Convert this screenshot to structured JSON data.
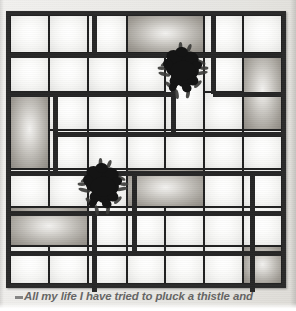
{
  "page": {
    "background_color": "#ecebe8",
    "border_color": "#2a2a2a"
  },
  "figure": {
    "type": "window-grid-illustration",
    "name": "window-pane-grid",
    "columns": 7,
    "rows": 7,
    "frame": {
      "x": 6,
      "y": 11,
      "width": 280,
      "height": 277,
      "border_width": 4
    },
    "pane_light_color": "#f6f6f4",
    "pane_dark_color": "#a19d96",
    "mullion_color": "#262626",
    "panes": [
      {
        "id": "r1c1",
        "col": 1,
        "row": 1,
        "col_span": 1,
        "row_span": 1,
        "shade": "light"
      },
      {
        "id": "r1c2",
        "col": 2,
        "row": 1,
        "col_span": 1,
        "row_span": 1,
        "shade": "light"
      },
      {
        "id": "r1c3",
        "col": 3,
        "row": 1,
        "col_span": 1,
        "row_span": 1,
        "shade": "light"
      },
      {
        "id": "r1c4",
        "col": 4,
        "row": 1,
        "col_span": 2,
        "row_span": 1,
        "shade": "dark"
      },
      {
        "id": "r1c6",
        "col": 6,
        "row": 1,
        "col_span": 1,
        "row_span": 1,
        "shade": "light"
      },
      {
        "id": "r1c7",
        "col": 7,
        "row": 1,
        "col_span": 1,
        "row_span": 1,
        "shade": "light"
      },
      {
        "id": "r2c1",
        "col": 1,
        "row": 2,
        "col_span": 1,
        "row_span": 1,
        "shade": "light"
      },
      {
        "id": "r2c2",
        "col": 2,
        "row": 2,
        "col_span": 1,
        "row_span": 1,
        "shade": "light"
      },
      {
        "id": "r2c3",
        "col": 3,
        "row": 2,
        "col_span": 1,
        "row_span": 1,
        "shade": "light"
      },
      {
        "id": "r2c4",
        "col": 4,
        "row": 2,
        "col_span": 1,
        "row_span": 1,
        "shade": "light"
      },
      {
        "id": "r2c5",
        "col": 5,
        "row": 2,
        "col_span": 1,
        "row_span": 2,
        "shade": "light"
      },
      {
        "id": "r2c6",
        "col": 6,
        "row": 2,
        "col_span": 1,
        "row_span": 1,
        "shade": "light"
      },
      {
        "id": "r2c7",
        "col": 7,
        "row": 2,
        "col_span": 1,
        "row_span": 2,
        "shade": "dark"
      },
      {
        "id": "r3c1",
        "col": 1,
        "row": 3,
        "col_span": 1,
        "row_span": 2,
        "shade": "dark"
      },
      {
        "id": "r3c2",
        "col": 2,
        "row": 3,
        "col_span": 1,
        "row_span": 1,
        "shade": "light"
      },
      {
        "id": "r3c3",
        "col": 3,
        "row": 3,
        "col_span": 1,
        "row_span": 1,
        "shade": "light"
      },
      {
        "id": "r3c4",
        "col": 4,
        "row": 3,
        "col_span": 1,
        "row_span": 1,
        "shade": "light"
      },
      {
        "id": "r3c6",
        "col": 6,
        "row": 3,
        "col_span": 1,
        "row_span": 1,
        "shade": "light"
      },
      {
        "id": "r4c2",
        "col": 2,
        "row": 4,
        "col_span": 1,
        "row_span": 1,
        "shade": "light"
      },
      {
        "id": "r4c3",
        "col": 3,
        "row": 4,
        "col_span": 1,
        "row_span": 1,
        "shade": "light"
      },
      {
        "id": "r4c4",
        "col": 4,
        "row": 4,
        "col_span": 1,
        "row_span": 1,
        "shade": "light"
      },
      {
        "id": "r4c5",
        "col": 5,
        "row": 4,
        "col_span": 1,
        "row_span": 1,
        "shade": "light"
      },
      {
        "id": "r4c6",
        "col": 6,
        "row": 4,
        "col_span": 1,
        "row_span": 1,
        "shade": "light"
      },
      {
        "id": "r4c7",
        "col": 7,
        "row": 4,
        "col_span": 1,
        "row_span": 1,
        "shade": "light"
      },
      {
        "id": "r5c1",
        "col": 1,
        "row": 5,
        "col_span": 1,
        "row_span": 1,
        "shade": "light"
      },
      {
        "id": "r5c2",
        "col": 2,
        "row": 5,
        "col_span": 1,
        "row_span": 1,
        "shade": "light"
      },
      {
        "id": "r5c3",
        "col": 3,
        "row": 5,
        "col_span": 1,
        "row_span": 1,
        "shade": "light"
      },
      {
        "id": "r5c4",
        "col": 4,
        "row": 5,
        "col_span": 2,
        "row_span": 1,
        "shade": "dark"
      },
      {
        "id": "r5c6",
        "col": 6,
        "row": 5,
        "col_span": 1,
        "row_span": 1,
        "shade": "light"
      },
      {
        "id": "r5c7",
        "col": 7,
        "row": 5,
        "col_span": 1,
        "row_span": 1,
        "shade": "light"
      },
      {
        "id": "r6c1",
        "col": 1,
        "row": 6,
        "col_span": 2,
        "row_span": 1,
        "shade": "dark"
      },
      {
        "id": "r6c3",
        "col": 3,
        "row": 6,
        "col_span": 1,
        "row_span": 1,
        "shade": "light"
      },
      {
        "id": "r6c4",
        "col": 4,
        "row": 6,
        "col_span": 1,
        "row_span": 1,
        "shade": "light"
      },
      {
        "id": "r6c5",
        "col": 5,
        "row": 6,
        "col_span": 1,
        "row_span": 1,
        "shade": "light"
      },
      {
        "id": "r6c6",
        "col": 6,
        "row": 6,
        "col_span": 1,
        "row_span": 1,
        "shade": "light"
      },
      {
        "id": "r6c7",
        "col": 7,
        "row": 6,
        "col_span": 1,
        "row_span": 1,
        "shade": "light"
      },
      {
        "id": "r7c1",
        "col": 1,
        "row": 7,
        "col_span": 1,
        "row_span": 1,
        "shade": "light"
      },
      {
        "id": "r7c2",
        "col": 2,
        "row": 7,
        "col_span": 1,
        "row_span": 1,
        "shade": "light"
      },
      {
        "id": "r7c3",
        "col": 3,
        "row": 7,
        "col_span": 1,
        "row_span": 1,
        "shade": "light"
      },
      {
        "id": "r7c4",
        "col": 4,
        "row": 7,
        "col_span": 1,
        "row_span": 1,
        "shade": "light"
      },
      {
        "id": "r7c5",
        "col": 5,
        "row": 7,
        "col_span": 1,
        "row_span": 1,
        "shade": "light"
      },
      {
        "id": "r7c6",
        "col": 6,
        "row": 7,
        "col_span": 1,
        "row_span": 1,
        "shade": "light"
      },
      {
        "id": "r7c7",
        "col": 7,
        "row": 7,
        "col_span": 1,
        "row_span": 1,
        "shade": "dark"
      }
    ],
    "mullions": [
      {
        "id": "v-col3-top",
        "orientation": "vertical",
        "x": 84,
        "y": 0,
        "length": 40,
        "thickness": 5
      },
      {
        "id": "v-col5-mid",
        "orientation": "vertical",
        "x": 163,
        "y": 40,
        "length": 79,
        "thickness": 5
      },
      {
        "id": "v-col6-top",
        "orientation": "vertical",
        "x": 203,
        "y": 0,
        "length": 79,
        "thickness": 5
      },
      {
        "id": "v-col1-upper",
        "orientation": "vertical",
        "x": 45,
        "y": 79,
        "length": 79,
        "thickness": 5
      },
      {
        "id": "v-col6-low",
        "orientation": "vertical",
        "x": 242,
        "y": 158,
        "length": 119,
        "thickness": 5
      },
      {
        "id": "v-col3-low",
        "orientation": "vertical",
        "x": 124,
        "y": 158,
        "length": 79,
        "thickness": 5
      },
      {
        "id": "v-col2-low",
        "orientation": "vertical",
        "x": 84,
        "y": 198,
        "length": 79,
        "thickness": 5
      },
      {
        "id": "h-row1",
        "orientation": "horizontal",
        "x": 0,
        "y": 40,
        "length": 272,
        "thickness": 5
      },
      {
        "id": "h-row2",
        "orientation": "horizontal",
        "x": 0,
        "y": 79,
        "length": 163,
        "thickness": 5
      },
      {
        "id": "h-row2b",
        "orientation": "horizontal",
        "x": 203,
        "y": 79,
        "length": 69,
        "thickness": 5
      },
      {
        "id": "h-row3",
        "orientation": "horizontal",
        "x": 45,
        "y": 119,
        "length": 227,
        "thickness": 5
      },
      {
        "id": "h-row4",
        "orientation": "horizontal",
        "x": 0,
        "y": 158,
        "length": 272,
        "thickness": 5
      },
      {
        "id": "h-row5",
        "orientation": "horizontal",
        "x": 0,
        "y": 198,
        "length": 272,
        "thickness": 5
      },
      {
        "id": "h-row6",
        "orientation": "horizontal",
        "x": 0,
        "y": 238,
        "length": 272,
        "thickness": 5
      }
    ],
    "thistles": [
      {
        "id": "thistle-upper",
        "label": "thistle-cluster-upper",
        "x": 152,
        "y": 42,
        "size": 62
      },
      {
        "id": "thistle-lower",
        "label": "thistle-cluster-lower",
        "x": 72,
        "y": 158,
        "size": 62
      }
    ]
  },
  "caption": {
    "marker": "bullet-dash",
    "text": "All my life I have tried to pluck a thistle and",
    "style": "bold-italic",
    "color": "#4a4a4a"
  }
}
